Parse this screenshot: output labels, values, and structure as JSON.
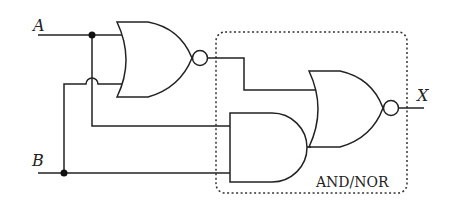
{
  "diagram": {
    "type": "logic-circuit",
    "inputs": [
      {
        "name": "A",
        "label": "A"
      },
      {
        "name": "B",
        "label": "B"
      }
    ],
    "output": {
      "name": "X",
      "label": "X"
    },
    "gates": [
      {
        "id": "nor1",
        "type": "NOR",
        "inputs": [
          "A",
          "B"
        ]
      },
      {
        "id": "and1",
        "type": "AND",
        "inputs": [
          "A",
          "B"
        ]
      },
      {
        "id": "nor2",
        "type": "NOR",
        "inputs": [
          "nor1",
          "and1"
        ],
        "output": "X"
      }
    ],
    "group": {
      "label": "AND/NOR",
      "contains": [
        "and1",
        "nor2"
      ]
    },
    "colors": {
      "line": "#222222",
      "background": "#ffffff"
    }
  }
}
